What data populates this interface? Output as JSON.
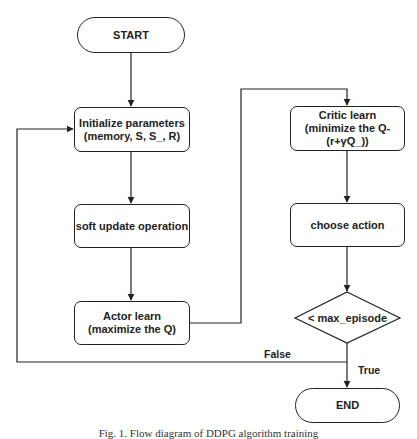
{
  "diagram": {
    "type": "flowchart",
    "nodes": {
      "start": {
        "label": "START",
        "shape": "terminator"
      },
      "init": {
        "line1": "Initialize parameters",
        "line2": "(memory, S, S_, R)",
        "shape": "process"
      },
      "soft_update": {
        "label": "soft update operation",
        "shape": "process"
      },
      "actor": {
        "line1": "Actor learn",
        "line2": "(maximize the Q)",
        "shape": "process"
      },
      "critic": {
        "line1": "Critic learn",
        "line2": "(minimize the Q-",
        "line3": "(r+γQ_))",
        "shape": "process"
      },
      "choose": {
        "label": "choose action",
        "shape": "process"
      },
      "decision": {
        "label": "< max_episode",
        "shape": "decision"
      },
      "end": {
        "label": "END",
        "shape": "terminator"
      }
    },
    "edges": [
      {
        "from": "start",
        "to": "init"
      },
      {
        "from": "init",
        "to": "soft_update"
      },
      {
        "from": "soft_update",
        "to": "actor"
      },
      {
        "from": "actor",
        "to": "critic"
      },
      {
        "from": "critic",
        "to": "choose"
      },
      {
        "from": "choose",
        "to": "decision"
      },
      {
        "from": "decision",
        "to": "init",
        "label": "False"
      },
      {
        "from": "decision",
        "to": "end",
        "label": "True"
      }
    ],
    "labels": {
      "false": "False",
      "true": "True"
    },
    "caption": "Fig. 1. Flow diagram of DDPG algorithm training"
  },
  "colors": {
    "stroke": "#222222",
    "background": "#ffffff"
  }
}
